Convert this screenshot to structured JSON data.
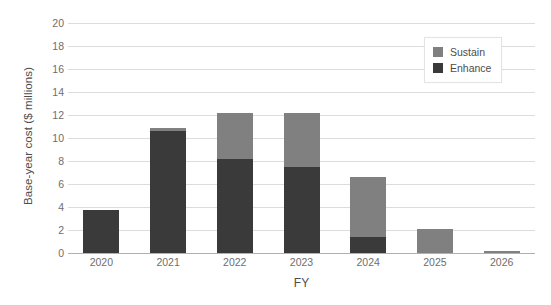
{
  "chart_data": {
    "type": "bar",
    "subtype": "stacked-bar",
    "title": "",
    "xlabel": "FY",
    "ylabel": "Base-year cost ($ millions)",
    "categories": [
      "2020",
      "2021",
      "2022",
      "2023",
      "2024",
      "2025",
      "2026"
    ],
    "series": [
      {
        "name": "Enhance",
        "color": "#3a3a3a",
        "values": [
          3.75,
          10.6,
          8.2,
          7.45,
          1.4,
          0,
          0
        ]
      },
      {
        "name": "Sustain",
        "color": "#808080",
        "values": [
          0,
          0.3,
          4.0,
          4.75,
          5.2,
          2.1,
          0.15
        ]
      }
    ],
    "totals": [
      3.75,
      10.9,
      12.2,
      12.2,
      6.6,
      2.1,
      0.15
    ],
    "ylim": [
      0,
      20
    ],
    "ytick_step": 2,
    "ytick_labels": [
      "0",
      "2",
      "4",
      "6",
      "8",
      "10",
      "12",
      "14",
      "16",
      "18",
      "20"
    ],
    "grid": true,
    "grid_axis": "y",
    "legend_position": "top-right",
    "legend_entries": [
      "Sustain",
      "Enhance"
    ],
    "stack_order_bottom_to_top": [
      "Enhance",
      "Sustain"
    ],
    "colors": {
      "sustain": "#808080",
      "enhance": "#3a3a3a",
      "gridline": "#dcdcdc",
      "axis_line": "#b0b0b0",
      "text": "#6e6e6e",
      "background": "#ffffff"
    }
  },
  "axes": {
    "y_title": "Base-year cost ($ millions)",
    "x_title": "FY"
  },
  "legend": {
    "items": [
      {
        "label": "Sustain",
        "swatch": "sustain"
      },
      {
        "label": "Enhance",
        "swatch": "enhance"
      }
    ]
  }
}
